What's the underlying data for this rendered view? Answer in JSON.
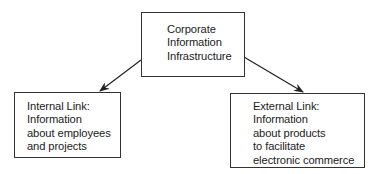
{
  "diagram": {
    "type": "hierarchy",
    "root": {
      "lines": [
        "Corporate",
        "Information",
        "Infrastructure"
      ]
    },
    "children": [
      {
        "lines": [
          "Internal Link:",
          "Information",
          "about employees",
          "and projects"
        ]
      },
      {
        "lines": [
          "External Link:",
          "Information",
          "about products",
          "to facilitate",
          "electronic commerce"
        ]
      }
    ],
    "edges": [
      {
        "from": "root",
        "to": "children.0"
      },
      {
        "from": "root",
        "to": "children.1"
      }
    ]
  }
}
